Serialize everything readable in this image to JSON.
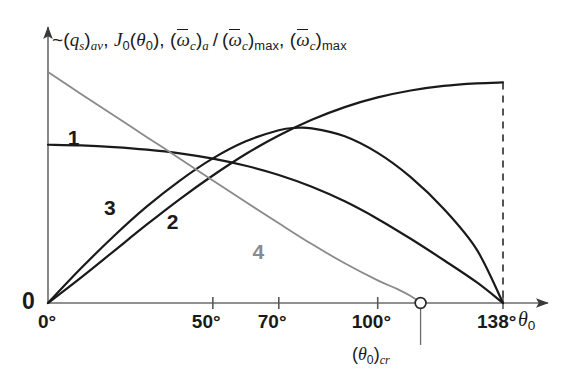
{
  "chart_data": {
    "type": "line",
    "title": "",
    "ylabel_parts": [
      "~(q_s)_av",
      "J_0(theta_0)",
      "(omega-bar_c)_a / (omega-bar_c)_max",
      "(omega-bar_c)_max"
    ],
    "ylabel_text": "~(qₛ)ₐᵥ, J₀(θ₀), (ω̄_c)ₐ/(ω̄_c)ₘₐₓ, (ω̄_c)ₘₐₓ",
    "xlabel": "θ₀",
    "xlabel_base": "θ",
    "xlabel_sub": "0",
    "xtick_labels": [
      "0°",
      "50°",
      "70°",
      "100°",
      "138°"
    ],
    "xtick_values": [
      0,
      50,
      70,
      100,
      138
    ],
    "origin_y_label": "0",
    "xlim": [
      0,
      150
    ],
    "ylim": [
      0,
      1.12
    ],
    "grid": false,
    "legend_position": "inline-curve-labels",
    "annotations": [
      {
        "name": "theta-0-critical",
        "text": "(θ₀)_cr",
        "text_base": "(θ",
        "text_sub1": "0",
        "text_mid": ")",
        "text_sub2": "cr",
        "x_value": 113,
        "marker": "open-circle",
        "marker_y_value": 0
      },
      {
        "name": "cutoff-dashed-line",
        "text": "",
        "x_value": 138,
        "style": "dashed-vertical"
      }
    ],
    "series": [
      {
        "name": "1",
        "label": "1",
        "color": "#1a1a1a",
        "label_x_value": 6,
        "label_y_value": 0.76,
        "points": [
          [
            0,
            0.685
          ],
          [
            10,
            0.682
          ],
          [
            20,
            0.675
          ],
          [
            30,
            0.664
          ],
          [
            40,
            0.648
          ],
          [
            50,
            0.625
          ],
          [
            60,
            0.594
          ],
          [
            70,
            0.554
          ],
          [
            80,
            0.503
          ],
          [
            90,
            0.44
          ],
          [
            100,
            0.364
          ],
          [
            110,
            0.278
          ],
          [
            120,
            0.186
          ],
          [
            130,
            0.09
          ],
          [
            138,
            0.0
          ]
        ]
      },
      {
        "name": "2",
        "label": "2",
        "color": "#1a1a1a",
        "label_x_value": 36,
        "label_y_value": 0.4,
        "points": [
          [
            0,
            0.0
          ],
          [
            10,
            0.15
          ],
          [
            20,
            0.29
          ],
          [
            30,
            0.418
          ],
          [
            40,
            0.53
          ],
          [
            50,
            0.626
          ],
          [
            60,
            0.7
          ],
          [
            70,
            0.748
          ],
          [
            75,
            0.758
          ],
          [
            80,
            0.756
          ],
          [
            90,
            0.722
          ],
          [
            100,
            0.65
          ],
          [
            110,
            0.545
          ],
          [
            120,
            0.408
          ],
          [
            130,
            0.232
          ],
          [
            138,
            0.0
          ]
        ]
      },
      {
        "name": "3",
        "label": "3",
        "color": "#1a1a1a",
        "label_x_value": 17,
        "label_y_value": 0.46,
        "points": [
          [
            0,
            0.0
          ],
          [
            10,
            0.11
          ],
          [
            20,
            0.225
          ],
          [
            30,
            0.34
          ],
          [
            40,
            0.45
          ],
          [
            50,
            0.552
          ],
          [
            60,
            0.645
          ],
          [
            70,
            0.725
          ],
          [
            80,
            0.793
          ],
          [
            90,
            0.848
          ],
          [
            100,
            0.89
          ],
          [
            110,
            0.92
          ],
          [
            120,
            0.94
          ],
          [
            130,
            0.951
          ],
          [
            138,
            0.955
          ]
        ]
      },
      {
        "name": "4",
        "label": "4",
        "color": "#8a8a8a",
        "label_x_value": 62,
        "label_y_value": 0.27,
        "points": [
          [
            0,
            1.0
          ],
          [
            10,
            0.905
          ],
          [
            20,
            0.812
          ],
          [
            30,
            0.718
          ],
          [
            40,
            0.625
          ],
          [
            50,
            0.53
          ],
          [
            60,
            0.437
          ],
          [
            70,
            0.345
          ],
          [
            80,
            0.255
          ],
          [
            90,
            0.172
          ],
          [
            100,
            0.098
          ],
          [
            106,
            0.06
          ],
          [
            110,
            0.03
          ],
          [
            113,
            0.0
          ]
        ]
      }
    ]
  }
}
